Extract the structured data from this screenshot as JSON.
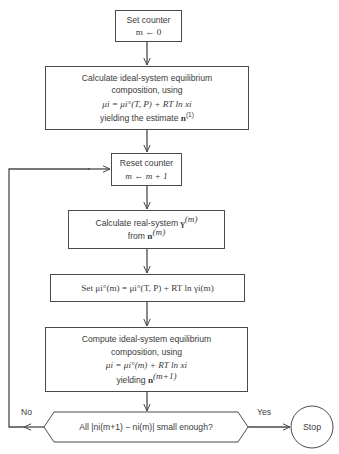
{
  "diagram": {
    "type": "flowchart",
    "nodes": {
      "set_counter": {
        "line1": "Set counter",
        "line2": "m ← 0"
      },
      "ideal_initial": {
        "line1": "Calculate ideal-system equilibrium",
        "line2": "composition, using",
        "equation": "μi = μi°(T, P) + RT ln xi",
        "line4_prefix": "yielding the estimate ",
        "line4_symbol": "n",
        "line4_sup": "(1)"
      },
      "reset_counter": {
        "line1": "Reset counter",
        "line2": "m ← m + 1"
      },
      "real_system": {
        "line1_prefix": "Calculate real-system ",
        "line1_symbol": "γ",
        "line1_sup": "(m)",
        "line2_prefix": "from ",
        "line2_symbol": "n",
        "line2_sup": "(m)"
      },
      "set_mu": {
        "text": "Set μi°(m) = μi°(T, P) + RT ln γi(m)"
      },
      "ideal_iter": {
        "line1": "Compute ideal-system equilibrium",
        "line2": "composition, using",
        "equation": "μi = μi°(m) + RT ln xi",
        "line4_prefix": "yielding ",
        "line4_symbol": "n",
        "line4_sup": "(m+1)"
      },
      "decision": {
        "text": "All |ni(m+1) − ni(m)| small enough?"
      },
      "stop": {
        "text": "Stop"
      }
    },
    "edge_labels": {
      "no": "No",
      "yes": "Yes"
    },
    "edges": [
      {
        "from": "set_counter",
        "to": "ideal_initial"
      },
      {
        "from": "ideal_initial",
        "to": "reset_counter"
      },
      {
        "from": "reset_counter",
        "to": "real_system"
      },
      {
        "from": "real_system",
        "to": "set_mu"
      },
      {
        "from": "set_mu",
        "to": "ideal_iter"
      },
      {
        "from": "ideal_iter",
        "to": "decision"
      },
      {
        "from": "decision",
        "to": "stop",
        "label": "Yes"
      },
      {
        "from": "decision",
        "to": "reset_counter",
        "label": "No"
      }
    ],
    "colors": {
      "line": "#4a4a4a",
      "text": "#3a3a3a",
      "background": "#ffffff"
    }
  }
}
